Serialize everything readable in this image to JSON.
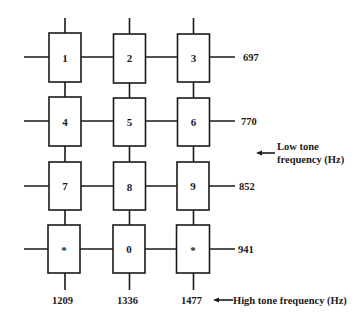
{
  "diagram": {
    "keys": [
      [
        "1",
        "2",
        "3"
      ],
      [
        "4",
        "5",
        "6"
      ],
      [
        "7",
        "8",
        "9"
      ],
      [
        "*",
        "0",
        "*"
      ]
    ],
    "low_tone_frequencies": [
      "697",
      "770",
      "852",
      "941"
    ],
    "high_tone_frequencies": [
      "1209",
      "1336",
      "1477"
    ],
    "low_tone_label_line1": "Low tone",
    "low_tone_label_line2": "frequency (Hz)",
    "high_tone_label": "High tone frequency (Hz)",
    "arrow_glyph": "←"
  },
  "colors": {
    "line": "#1a1a1a",
    "background": "#ffffff"
  }
}
